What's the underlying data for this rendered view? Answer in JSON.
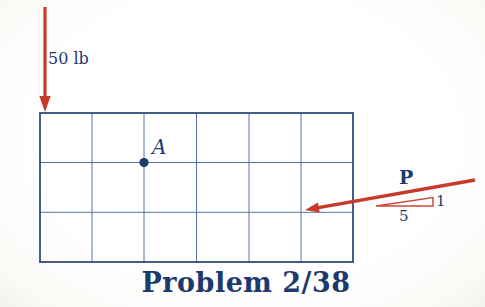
{
  "figure": {
    "caption": "Problem 2/38",
    "labels": {
      "vertical_force": "50 lb",
      "point_a": "A",
      "force_p": "P",
      "slope_rise": "1",
      "slope_run": "5"
    },
    "grid": {
      "columns": 6,
      "rows": 3
    },
    "colors": {
      "arrow_red": "#c8392b",
      "slope_triangle_red": "#cd4a38",
      "navy_text": "#1d3a6d",
      "grid_line": "#5472a8",
      "grid_border": "#2f4e7d",
      "background": "#fdfdfb"
    }
  }
}
